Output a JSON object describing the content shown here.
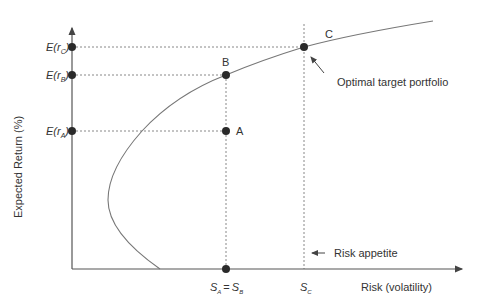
{
  "figure": {
    "y_axis_label": "Expected Return (%)",
    "x_axis_label": "Risk (volatility)",
    "y_ticks": [
      {
        "id": "rC",
        "label_main": "E(r",
        "label_sub": "C",
        "label_close": ")"
      },
      {
        "id": "rB",
        "label_main": "E(r",
        "label_sub": "B",
        "label_close": ")"
      },
      {
        "id": "rA",
        "label_main": "E(r",
        "label_sub": "A",
        "label_close": ")"
      }
    ],
    "x_ticks": [
      {
        "id": "SAB",
        "s1": "S",
        "sub1": "A",
        "eq": "=",
        "s2": "S",
        "sub2": "B"
      },
      {
        "id": "SC",
        "s1": "S",
        "sub1": "C"
      }
    ],
    "points": [
      {
        "name": "A",
        "label": "A"
      },
      {
        "name": "B",
        "label": "B"
      },
      {
        "name": "C",
        "label": "C"
      }
    ],
    "annotations": {
      "optimal": "Optimal target portfolio",
      "risk_appetite": "Risk appetite"
    },
    "colors": {
      "axis": "#555555",
      "curve": "#777777",
      "dot": "#2a2a2a",
      "guide": "#888888",
      "text": "#333333"
    }
  }
}
